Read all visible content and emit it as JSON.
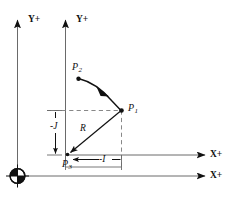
{
  "figure": {
    "type": "technical-diagram",
    "background_color": "#ffffff",
    "line_color": "#3f3f3f",
    "solid_color": "#111111",
    "width": 237,
    "height": 197
  },
  "axes": {
    "machine": {
      "y_label": "Y+",
      "x_label": "X+"
    },
    "work": {
      "y_label": "Y+",
      "x_label": "X+"
    }
  },
  "points": {
    "p1": {
      "label": "P",
      "sub": "1"
    },
    "p2": {
      "label": "P",
      "sub": "2"
    },
    "p3": {
      "label": "P",
      "sub": "3"
    }
  },
  "dimensions": {
    "radius": {
      "label": "R"
    },
    "j_offset": {
      "label": "-J"
    },
    "i_offset": {
      "label": "-I"
    }
  },
  "origin_marker": {
    "name": "machine-origin-datum"
  }
}
